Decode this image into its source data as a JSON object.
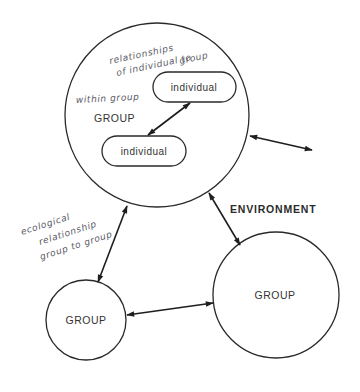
{
  "diagram": {
    "nodes": {
      "group_main": {
        "label": "GROUP"
      },
      "individual_top": {
        "label": "individual"
      },
      "individual_bottom": {
        "label": "individual"
      },
      "group_small": {
        "label": "GROUP"
      },
      "group_large": {
        "label": "GROUP"
      }
    },
    "labels": {
      "environment": "ENVIRONMENT"
    },
    "handwritten_notes": {
      "relationships_line1": "relationships",
      "relationships_line2": "of individual to",
      "relationships_line3": "group",
      "within_group": "within group",
      "ecological_line1": "ecological",
      "ecological_line2": "relationship",
      "ecological_line3": "group to group"
    },
    "edges": [
      {
        "from": "individual_top",
        "to": "individual_bottom",
        "type": "bidirectional"
      },
      {
        "from": "group_main",
        "to": "outside",
        "type": "bidirectional"
      },
      {
        "from": "group_main",
        "to": "group_small",
        "type": "bidirectional"
      },
      {
        "from": "group_main",
        "to": "group_large",
        "type": "bidirectional"
      },
      {
        "from": "group_small",
        "to": "group_large",
        "type": "bidirectional"
      }
    ]
  }
}
